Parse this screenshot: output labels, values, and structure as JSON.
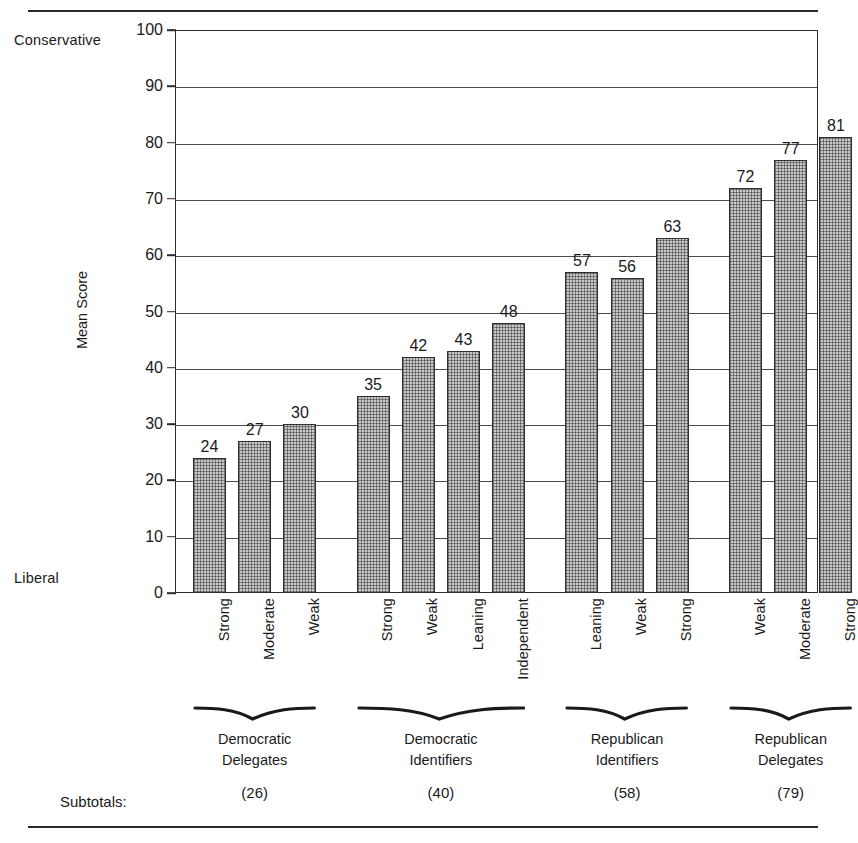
{
  "chart_data": {
    "type": "bar",
    "title": "",
    "xlabel": "",
    "ylabel": "Mean Score",
    "ylim": [
      0,
      100
    ],
    "ytick_step": 10,
    "yticks": [
      0,
      10,
      20,
      30,
      40,
      50,
      60,
      70,
      80,
      90,
      100
    ],
    "grid": true,
    "legend": "none",
    "axis_anchor_high": "Conservative",
    "axis_anchor_low": "Liberal",
    "subtotals_label": "Subtotals:",
    "categories": [
      "Strong",
      "Moderate",
      "Weak",
      "Strong",
      "Weak",
      "Leaning",
      "Independent",
      "Leaning",
      "Weak",
      "Strong",
      "Weak",
      "Moderate",
      "Strong"
    ],
    "values": [
      24,
      27,
      30,
      35,
      42,
      43,
      48,
      57,
      56,
      63,
      72,
      77,
      81
    ],
    "bars": [
      {
        "label": "Strong",
        "value": 24,
        "group": 0
      },
      {
        "label": "Moderate",
        "value": 27,
        "group": 0
      },
      {
        "label": "Weak",
        "value": 30,
        "group": 0
      },
      {
        "label": "Strong",
        "value": 35,
        "group": 1
      },
      {
        "label": "Weak",
        "value": 42,
        "group": 1
      },
      {
        "label": "Leaning",
        "value": 43,
        "group": 1
      },
      {
        "label": "Independent",
        "value": 48,
        "group": 1
      },
      {
        "label": "Leaning",
        "value": 57,
        "group": 2
      },
      {
        "label": "Weak",
        "value": 56,
        "group": 2
      },
      {
        "label": "Strong",
        "value": 63,
        "group": 2
      },
      {
        "label": "Weak",
        "value": 72,
        "group": 3
      },
      {
        "label": "Moderate",
        "value": 77,
        "group": 3
      },
      {
        "label": "Strong",
        "value": 81,
        "group": 3
      }
    ],
    "groups": [
      {
        "name_line1": "Democratic",
        "name_line2": "Delegates",
        "subtotal": "(26)",
        "first_bar": 0,
        "last_bar": 2
      },
      {
        "name_line1": "Democratic",
        "name_line2": "Identifiers",
        "subtotal": "(40)",
        "first_bar": 3,
        "last_bar": 6
      },
      {
        "name_line1": "Republican",
        "name_line2": "Identifiers",
        "subtotal": "(58)",
        "first_bar": 7,
        "last_bar": 9
      },
      {
        "name_line1": "Republican",
        "name_line2": "Delegates",
        "subtotal": "(79)",
        "first_bar": 10,
        "last_bar": 12
      }
    ],
    "colors": {
      "bar_fill": "#c9c9c9",
      "bar_border": "#2f2f2f",
      "axis": "#2b2b2b",
      "grid": "#4a4a4a",
      "text": "#1a1a1a",
      "background": "#ffffff"
    }
  }
}
